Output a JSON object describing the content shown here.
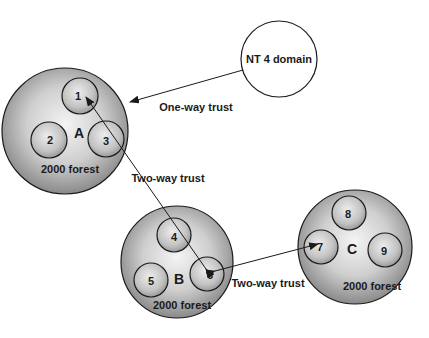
{
  "diagram": {
    "nt_domain": {
      "label": "NT 4 domain"
    },
    "forests": [
      {
        "id": "A",
        "label": "A",
        "caption": "2000 forest",
        "domains": [
          "1",
          "2",
          "3"
        ]
      },
      {
        "id": "B",
        "label": "B",
        "caption": "2000 forest",
        "domains": [
          "4",
          "5",
          "6"
        ]
      },
      {
        "id": "C",
        "label": "C",
        "caption": "2000 forest",
        "domains": [
          "7",
          "8",
          "9"
        ]
      }
    ],
    "trusts": [
      {
        "label": "One-way trust",
        "from": "NT 4 domain",
        "to": "A"
      },
      {
        "label": "Two-way trust",
        "between": [
          "1",
          "6"
        ]
      },
      {
        "label": "Two-way trust",
        "between": [
          "6",
          "7"
        ]
      }
    ]
  }
}
